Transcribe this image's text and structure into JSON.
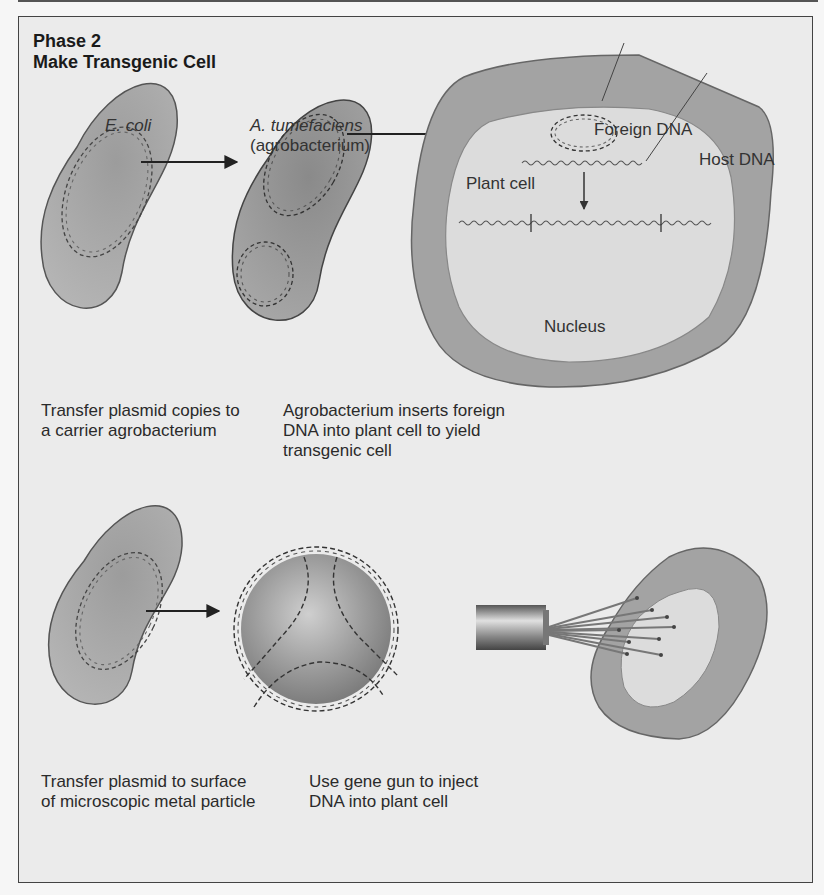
{
  "header": {
    "phase": "Phase 2",
    "title": "Make Transgenic Cell"
  },
  "panels": {
    "top_left": {
      "organism_1": "E. coli",
      "organism_2_name": "A. tumefaciens",
      "organism_2_common": "(agrobacterium)",
      "caption_line1": "Transfer plasmid copies to",
      "caption_line2": "a carrier agrobacterium"
    },
    "top_right": {
      "label_foreign_dna": "Foreign DNA",
      "label_host_dna": "Host DNA",
      "label_plant_cell": "Plant cell",
      "label_nucleus": "Nucleus",
      "caption_line1": "Agrobacterium inserts foreign",
      "caption_line2": "DNA into plant cell to yield",
      "caption_line3": "transgenic cell"
    },
    "bottom_left": {
      "caption_line1": "Transfer plasmid to surface",
      "caption_line2": "of microscopic metal particle"
    },
    "bottom_right": {
      "caption_line1": "Use gene gun to inject",
      "caption_line2": "DNA into plant cell"
    }
  },
  "colors": {
    "background": "#ebebeb",
    "cell_fill": "#9a9a9a",
    "cell_inner": "#d9d9d9",
    "outline": "#555555",
    "text": "#333333"
  }
}
